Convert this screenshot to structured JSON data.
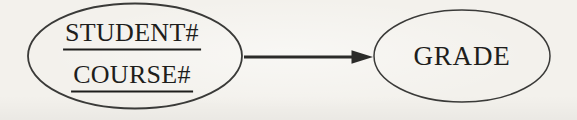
{
  "diagram_type": "functional-dependency",
  "nodes": {
    "determinant": {
      "line1": "STUDENT#",
      "line2": "COURSE#",
      "underlined": true
    },
    "dependent": {
      "label": "GRADE",
      "underlined": false
    }
  },
  "edge": {
    "from": "determinant",
    "to": "dependent",
    "style": "solid-arrow-right"
  },
  "colors": {
    "background": "#f3f1ec",
    "stroke": "#3a3a38",
    "arrow": "#2b2b29",
    "text": "#1e1e1c"
  }
}
